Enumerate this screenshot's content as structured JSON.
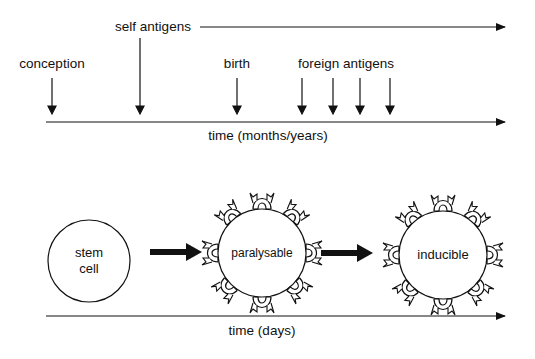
{
  "top_timeline": {
    "axis_label": "time (months/years)",
    "events": {
      "conception": "conception",
      "self_antigens": "self antigens",
      "birth": "birth",
      "foreign_antigens": "foreign antigens"
    }
  },
  "bottom_timeline": {
    "axis_label": "time (days)",
    "stages": {
      "stem_cell_line1": "stem",
      "stem_cell_line2": "cell",
      "paralysable": "paralysable",
      "inducible": "inducible"
    }
  }
}
